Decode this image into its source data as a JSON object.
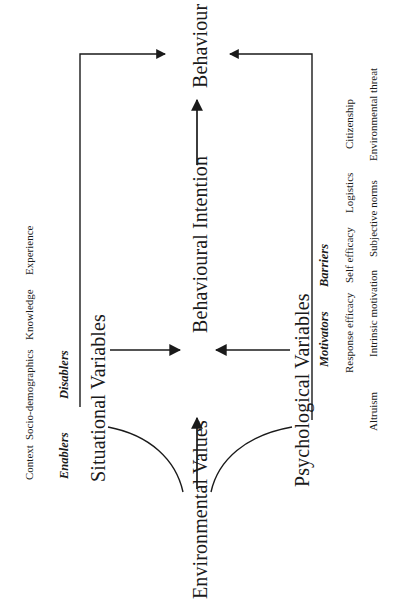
{
  "figure": {
    "type": "flow-diagram",
    "orientation": "rotated-90-ccw",
    "line_color": "#1a1a1a",
    "text_color": "#1a1a1a",
    "background": "#ffffff"
  },
  "nodes": {
    "environmental_values": "Environmental Values",
    "situational_variables": "Situational Variables",
    "psychological_variables": "Psychological Variables",
    "behavioural_intention": "Behavioural Intention",
    "behaviour": "Behaviour"
  },
  "situational": {
    "groups": [
      {
        "label": "Enablers"
      },
      {
        "label": "Disablers"
      }
    ],
    "items": [
      {
        "label": "Context"
      },
      {
        "label": "Socio-demographics"
      },
      {
        "label": "Knowledge"
      },
      {
        "label": "Experience"
      }
    ]
  },
  "psychological": {
    "groups": [
      {
        "label": "Motivators"
      },
      {
        "label": "Barriers"
      }
    ],
    "items_row_outer": [
      {
        "label": "Altruism"
      },
      {
        "label": "Intrinsic motivation"
      },
      {
        "label": "Subjective norms"
      },
      {
        "label": "Environmental threat"
      }
    ],
    "items_row_inner": [
      {
        "label": "Response efficacy"
      },
      {
        "label": "Self efficacy"
      },
      {
        "label": "Logistics"
      },
      {
        "label": "Citizenship"
      }
    ]
  },
  "connectors": [
    {
      "name": "values-to-intention",
      "kind": "straight-arrow"
    },
    {
      "name": "values-to-situational",
      "kind": "curve"
    },
    {
      "name": "values-to-psychological",
      "kind": "curve"
    },
    {
      "name": "situational-to-intention",
      "kind": "straight-arrow"
    },
    {
      "name": "psychological-to-intention",
      "kind": "straight-arrow"
    },
    {
      "name": "intention-to-behaviour",
      "kind": "straight-arrow"
    },
    {
      "name": "situational-to-behaviour",
      "kind": "elbow-arrow"
    },
    {
      "name": "psychological-to-behaviour",
      "kind": "elbow-arrow"
    }
  ]
}
